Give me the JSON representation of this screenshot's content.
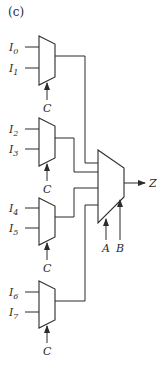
{
  "figure_label": "(c)",
  "small_muxes": [
    {
      "inputs": [
        {
          "base": "I",
          "sub": "0"
        },
        {
          "base": "I",
          "sub": "1"
        }
      ],
      "select": "C"
    },
    {
      "inputs": [
        {
          "base": "I",
          "sub": "2"
        },
        {
          "base": "I",
          "sub": "3"
        }
      ],
      "select": "C"
    },
    {
      "inputs": [
        {
          "base": "I",
          "sub": "4"
        },
        {
          "base": "I",
          "sub": "5"
        }
      ],
      "select": "C"
    },
    {
      "inputs": [
        {
          "base": "I",
          "sub": "6"
        },
        {
          "base": "I",
          "sub": "7"
        }
      ],
      "select": "C"
    }
  ],
  "main_mux": {
    "selects": [
      "A",
      "B"
    ],
    "output": "Z"
  },
  "colors": {
    "line": "#2b2b2b",
    "background": "#ffffff"
  }
}
